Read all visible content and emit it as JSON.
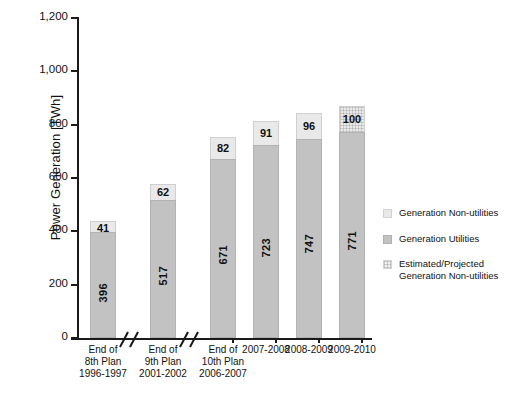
{
  "chart_data": {
    "type": "bar",
    "title": "",
    "subtitle": "",
    "xlabel": "",
    "ylabel": "Power Generation [TWh]",
    "ylim": [
      0,
      1200
    ],
    "ytick_values": [
      0,
      200,
      400,
      600,
      800,
      1000,
      1200
    ],
    "ytick_labels": [
      "0",
      "200",
      "400",
      "600",
      "800",
      "1,000",
      "1,200"
    ],
    "grid": false,
    "stacked": true,
    "legend_position": "right",
    "axis_breaks": 2,
    "categories": [
      "End of 8th Plan 1996-1997",
      "End of 9th Plan 2001-2002",
      "End of 10th Plan 2006-2007",
      "2007-2008",
      "2008-2009",
      "2009-2010"
    ],
    "series": [
      {
        "name": "Generation Utilities",
        "values": [
          396,
          517,
          671,
          723,
          747,
          771
        ]
      },
      {
        "name": "Generation Non-utilities",
        "values": [
          41,
          62,
          82,
          91,
          96,
          100
        ]
      }
    ],
    "estimated_categories": [
      "2009-2010"
    ],
    "totals": [
      437,
      579,
      753,
      814,
      843,
      871
    ]
  },
  "axis": {
    "y_title": "Power Generation [TWh]",
    "ticks": [
      {
        "label": "1,200",
        "value": 1200
      },
      {
        "label": "1,000",
        "value": 1000
      },
      {
        "label": "800",
        "value": 800
      },
      {
        "label": "600",
        "value": 600
      },
      {
        "label": "400",
        "value": 400
      },
      {
        "label": "200",
        "value": 200
      },
      {
        "label": "0",
        "value": 0
      }
    ]
  },
  "bars": [
    {
      "key": "end-8th-plan",
      "utilities": "396",
      "nonutilities": "41",
      "utilities_value": 396,
      "nonutilities_value": 41,
      "estimated": false,
      "label_lines": [
        "End of",
        "8th Plan",
        "1996-1997"
      ]
    },
    {
      "key": "end-9th-plan",
      "utilities": "517",
      "nonutilities": "62",
      "utilities_value": 517,
      "nonutilities_value": 62,
      "estimated": false,
      "label_lines": [
        "End of",
        "9th Plan",
        "2001-2002"
      ]
    },
    {
      "key": "end-10th-plan",
      "utilities": "671",
      "nonutilities": "82",
      "utilities_value": 671,
      "nonutilities_value": 82,
      "estimated": false,
      "label_lines": [
        "End of",
        "10th Plan",
        "2006-2007"
      ]
    },
    {
      "key": "2007-2008",
      "utilities": "723",
      "nonutilities": "91",
      "utilities_value": 723,
      "nonutilities_value": 91,
      "estimated": false,
      "label_lines": [
        "2007-2008"
      ]
    },
    {
      "key": "2008-2009",
      "utilities": "747",
      "nonutilities": "96",
      "utilities_value": 747,
      "nonutilities_value": 96,
      "estimated": false,
      "label_lines": [
        "2008-2009"
      ]
    },
    {
      "key": "2009-2010",
      "utilities": "771",
      "nonutilities": "100",
      "utilities_value": 771,
      "nonutilities_value": 100,
      "estimated": true,
      "label_lines": [
        "2009-2010"
      ]
    }
  ],
  "legend": {
    "items": [
      {
        "label": "Generation Non-utilities",
        "style": "nonutilities",
        "color": "#e9e9e9"
      },
      {
        "label": "Generation Utilities",
        "style": "utilities",
        "color": "#c2c2c2"
      },
      {
        "label": "Estimated/Projected Generation Non-utilities",
        "style": "estimated",
        "color": "#eeeeee"
      }
    ]
  },
  "colors": {
    "utilities": "#c2c2c2",
    "nonutilities": "#e9e9e9",
    "estimated": "#eeeeee",
    "axis": "#1a1a1a",
    "background": "#ffffff"
  }
}
